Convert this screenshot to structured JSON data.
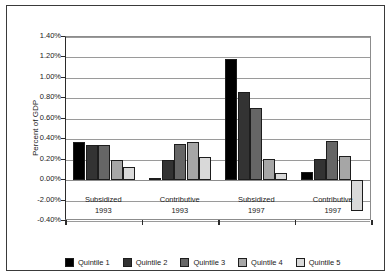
{
  "chart_data": {
    "type": "bar",
    "title": "",
    "xlabel": "",
    "ylabel": "Percent of GDP",
    "ylim": [
      -0.4,
      1.4
    ],
    "grid": true,
    "legend_position": "bottom",
    "ytick_labels": [
      "1.40%",
      "1.20%",
      "1.00%",
      "0.80%",
      "0.60%",
      "0.40%",
      "0.20%",
      "0.00%",
      "-2.00%",
      "-0.40%"
    ],
    "ytick_values": [
      1.4,
      1.2,
      1.0,
      0.8,
      0.6,
      0.4,
      0.2,
      0.0,
      -0.2,
      -0.4
    ],
    "categories": [
      "Subsidized 1993",
      "Contributive 1993",
      "Subsidized 1997",
      "Contributive 1997"
    ],
    "category_lines": [
      [
        "Subsidized",
        "1993"
      ],
      [
        "Contributive",
        "1993"
      ],
      [
        "Subsidized",
        "1997"
      ],
      [
        "Contributive",
        "1997"
      ]
    ],
    "series": [
      {
        "name": "Quintile 1",
        "color": "#000000",
        "values": [
          0.37,
          0.02,
          1.18,
          0.08
        ]
      },
      {
        "name": "Quintile 2",
        "color": "#333333",
        "values": [
          0.345,
          0.2,
          0.86,
          0.21
        ]
      },
      {
        "name": "Quintile 3",
        "color": "#666666",
        "values": [
          0.34,
          0.355,
          0.71,
          0.38
        ]
      },
      {
        "name": "Quintile 4",
        "color": "#a6a6a6",
        "values": [
          0.2,
          0.37,
          0.21,
          0.24
        ]
      },
      {
        "name": "Quintile 5",
        "color": "#d9d9d9",
        "values": [
          0.13,
          0.23,
          0.07,
          -0.3
        ]
      }
    ]
  }
}
